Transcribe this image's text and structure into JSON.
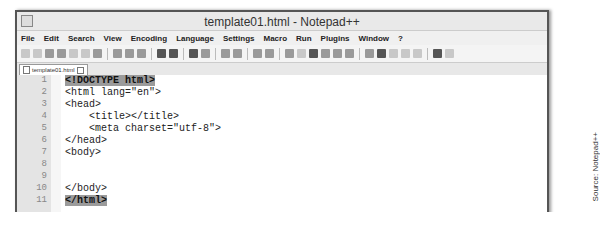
{
  "window": {
    "title": "template01.html - Notepad++"
  },
  "menu": [
    "File",
    "Edit",
    "Search",
    "View",
    "Encoding",
    "Language",
    "Settings",
    "Macro",
    "Run",
    "Plugins",
    "Window",
    "?"
  ],
  "tab": {
    "label": "template01.html"
  },
  "editor": {
    "lines": [
      {
        "n": "1",
        "text": "<!DOCTYPE html>"
      },
      {
        "n": "2",
        "text": "<html lang=\"en\">"
      },
      {
        "n": "3",
        "text": "<head>"
      },
      {
        "n": "4",
        "text": "    <title></title>"
      },
      {
        "n": "5",
        "text": "    <meta charset=\"utf-8\">"
      },
      {
        "n": "6",
        "text": "</head>"
      },
      {
        "n": "7",
        "text": "<body>"
      },
      {
        "n": "8",
        "text": ""
      },
      {
        "n": "9",
        "text": ""
      },
      {
        "n": "10",
        "text": "</body>"
      },
      {
        "n": "11",
        "text": "</html>"
      }
    ]
  },
  "caption": "Source: Notepad++"
}
